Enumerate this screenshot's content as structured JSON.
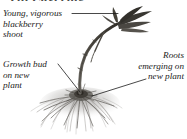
{
  "figure": {
    "width": 187,
    "height": 139,
    "background_color": "#ffffff",
    "cropped_heading_remnant": "Tip Layering",
    "callouts": [
      {
        "id": "shoot",
        "text": "Young, vigorous\nblackberry\nshoot",
        "align": "left",
        "leader": "horizontal-right"
      },
      {
        "id": "bud",
        "text": "Growth bud\non new\nplant",
        "align": "left",
        "leader": "diagonal-down-right"
      },
      {
        "id": "roots",
        "text": "Roots\nemerging on\nnew plant",
        "align": "right",
        "leader": "diagonal-down-left"
      }
    ],
    "colors": {
      "text": "#1c1c1c",
      "leader_line": "#1a1a1a",
      "cane": "#5a5650",
      "cane_dark": "#3b3832",
      "leaf": "#3a3833",
      "roots": "#6e6b66",
      "crown": "#403d38"
    },
    "art_elements": [
      "arching cane",
      "leaf cluster at cane tip",
      "crown / growth bud",
      "fibrous root mass"
    ]
  }
}
